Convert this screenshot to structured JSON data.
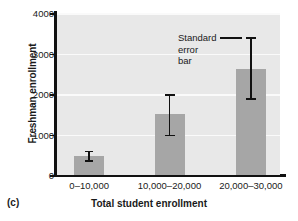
{
  "chart_data": {
    "type": "bar",
    "title": "",
    "panel_label": "(c)",
    "xlabel": "Total student enrollment",
    "ylabel": "Freshman enrollment",
    "categories": [
      "0–10,000",
      "10,000–20,000",
      "20,000–30,000"
    ],
    "values": [
      480,
      1500,
      2620
    ],
    "errors_low": [
      370,
      1000,
      1900
    ],
    "errors_high": [
      600,
      2000,
      3400
    ],
    "ylim": [
      0,
      4000
    ],
    "yticks": [
      0,
      1000,
      2000,
      3000,
      4000
    ],
    "ytick_labels": [
      "0",
      "1000",
      "2000",
      "3000",
      "4000"
    ],
    "grid": true,
    "legend": "none",
    "bar_color": "#a6a6a6",
    "plot_background": "#e8e8e8",
    "axis_color": "#111111",
    "gridline_color": "#fafafa",
    "annotations": [
      {
        "name": "standard-error-bar-callout",
        "lines": [
          "Standard",
          "error",
          "bar"
        ],
        "points_to_series_index": 2
      }
    ]
  }
}
